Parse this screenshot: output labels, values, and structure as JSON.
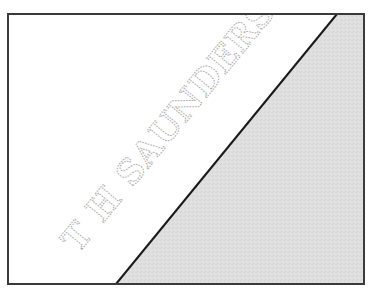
{
  "illustration": {
    "title": "Paper watermark diagram",
    "watermark_text": "T H SAUNDERS",
    "colors": {
      "paper": "#ffffff",
      "folded_region": "#dedede",
      "border": "#3a3a3a",
      "fold_line": "#1a1a1a",
      "watermark_outline": "#a9a9a9"
    }
  }
}
